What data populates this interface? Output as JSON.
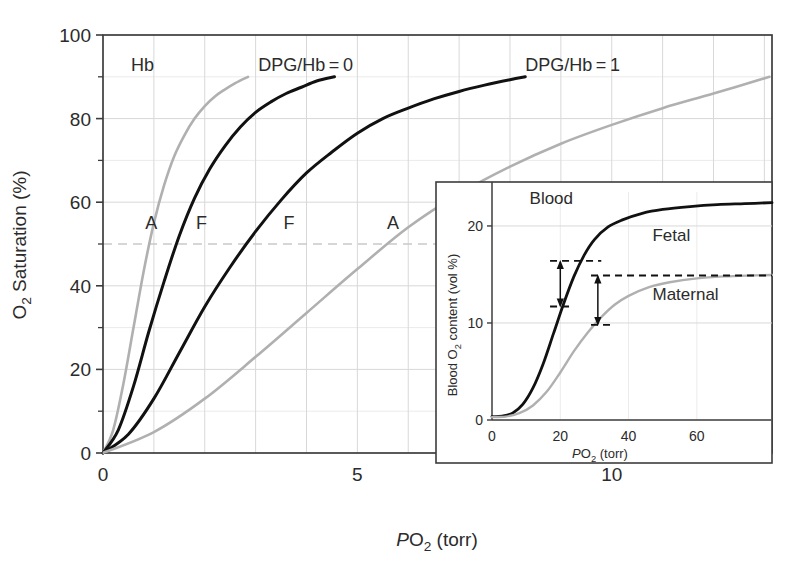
{
  "figure": {
    "background_color": "#ffffff",
    "frame_color": "#3c3c3c",
    "gridline_color_major": "#d8d8d8",
    "gridline_color_minor": "#ebebeb",
    "curve_color_dark": "#111111",
    "curve_color_light": "#b0b0b0",
    "dashed_marker_color": "#111111",
    "half_saturation_line_color": "#c9c9c9"
  },
  "chart_data": [
    {
      "id": "main",
      "type": "line",
      "title": "",
      "xlabel": "PO2 (torr)",
      "xlabel_parts": {
        "italic": "P",
        "normal": "O",
        "subscript": "2",
        "tail": " (torr)"
      },
      "ylabel": "O2 Saturation (%)",
      "ylabel_parts": {
        "normal": "O",
        "subscript": "2",
        "tail": " Saturation (%)"
      },
      "xlim": [
        0,
        13.15
      ],
      "ylim": [
        0,
        100
      ],
      "xticks": [
        0,
        5,
        10
      ],
      "xtick_labels": [
        "0",
        "5",
        "10"
      ],
      "yticks": [
        0,
        20,
        40,
        60,
        80,
        100
      ],
      "ytick_labels": [
        "0",
        "20",
        "40",
        "60",
        "80",
        "100"
      ],
      "y_major_gridlines": [
        20,
        40,
        60,
        80
      ],
      "y_minor_gridlines": [
        10,
        30,
        50,
        70,
        90
      ],
      "x_major_gridlines": [
        1,
        2,
        3,
        4,
        5,
        6,
        7,
        8,
        9,
        10,
        11,
        12,
        13
      ],
      "grid": true,
      "legend_position": "inline-annotations",
      "half_saturation_reference": 50,
      "annotations": [
        {
          "name": "hb-label",
          "text": "Hb",
          "x": 0.55,
          "y": 91.5
        },
        {
          "name": "dpg-hb-0-label",
          "text": "DPG/Hb = 0",
          "x": 3.05,
          "y": 91.5
        },
        {
          "name": "dpg-hb-1-label",
          "text": "DPG/Hb = 1",
          "x": 8.3,
          "y": 91.5
        },
        {
          "name": "curve-label-a-left",
          "text": "A",
          "x": 0.83,
          "y": 53.5
        },
        {
          "name": "curve-label-f-left",
          "text": "F",
          "x": 1.83,
          "y": 53.5
        },
        {
          "name": "curve-label-f-right",
          "text": "F",
          "x": 3.55,
          "y": 53.5
        },
        {
          "name": "curve-label-a-right",
          "text": "A",
          "x": 5.58,
          "y": 53.5
        }
      ],
      "series": [
        {
          "name": "Hb A, DPG/Hb = 0",
          "label": "A",
          "color": "#b0b0b0",
          "style": "solid",
          "p50": 1.06,
          "hill_n": 2.55,
          "ymax": 90,
          "x_end": 2.85,
          "points": [
            [
              0,
              0
            ],
            [
              0.2,
              5.5
            ],
            [
              0.4,
              16.5
            ],
            [
              0.6,
              30
            ],
            [
              0.8,
              43.5
            ],
            [
              1.0,
              55
            ],
            [
              1.2,
              64
            ],
            [
              1.4,
              71
            ],
            [
              1.6,
              76
            ],
            [
              1.8,
              80
            ],
            [
              2.0,
              83
            ],
            [
              2.2,
              85.3
            ],
            [
              2.4,
              87
            ],
            [
              2.6,
              88.5
            ],
            [
              2.85,
              90
            ]
          ]
        },
        {
          "name": "Hb F, DPG/Hb = 0",
          "label": "F",
          "color": "#111111",
          "style": "solid",
          "p50": 1.62,
          "hill_n": 2.55,
          "ymax": 90,
          "x_end": 4.55,
          "points": [
            [
              0,
              0
            ],
            [
              0.3,
              5.5
            ],
            [
              0.6,
              16
            ],
            [
              0.9,
              29
            ],
            [
              1.2,
              41
            ],
            [
              1.5,
              52
            ],
            [
              1.8,
              61
            ],
            [
              2.1,
              68
            ],
            [
              2.4,
              73.5
            ],
            [
              2.7,
              78
            ],
            [
              3.0,
              81.5
            ],
            [
              3.3,
              84
            ],
            [
              3.6,
              86
            ],
            [
              3.9,
              87.5
            ],
            [
              4.2,
              89
            ],
            [
              4.55,
              90
            ]
          ]
        },
        {
          "name": "Hb F, DPG/Hb = 1",
          "label": "F",
          "color": "#111111",
          "style": "solid",
          "p50": 3.05,
          "hill_n": 2.55,
          "ymax": 90,
          "x_end": 8.3,
          "points": [
            [
              0,
              0
            ],
            [
              0.5,
              4.5
            ],
            [
              1.0,
              13
            ],
            [
              1.5,
              24
            ],
            [
              2.0,
              35
            ],
            [
              2.5,
              44.5
            ],
            [
              3.0,
              53
            ],
            [
              3.5,
              60.5
            ],
            [
              4.0,
              67
            ],
            [
              4.5,
              72
            ],
            [
              5.0,
              76.5
            ],
            [
              5.5,
              80
            ],
            [
              6.0,
              82.5
            ],
            [
              6.5,
              84.7
            ],
            [
              7.0,
              86.5
            ],
            [
              7.5,
              88
            ],
            [
              8.0,
              89.3
            ],
            [
              8.3,
              90
            ]
          ]
        },
        {
          "name": "Hb A, DPG/Hb = 1",
          "label": "A",
          "color": "#b0b0b0",
          "style": "solid",
          "p50": 5.3,
          "hill_n": 2.55,
          "ymax": 90,
          "x_end": 13.1,
          "points": [
            [
              0,
              0
            ],
            [
              1.0,
              5
            ],
            [
              2.0,
              13
            ],
            [
              3.0,
              23
            ],
            [
              4.0,
              33.5
            ],
            [
              5.0,
              44
            ],
            [
              6.0,
              54
            ],
            [
              7.0,
              62
            ],
            [
              8.0,
              68.5
            ],
            [
              9.0,
              74
            ],
            [
              10.0,
              78.5
            ],
            [
              11.0,
              82.5
            ],
            [
              12.0,
              86
            ],
            [
              13.1,
              90
            ]
          ]
        }
      ]
    },
    {
      "id": "inset",
      "type": "line",
      "title": "Blood",
      "xlabel": "PO2 (torr)",
      "xlabel_parts": {
        "italic": "P",
        "normal": "O",
        "subscript": "2",
        "tail": " (torr)"
      },
      "ylabel": "Blood O2 content (vol %)",
      "ylabel_parts": {
        "prefix": "Blood O",
        "subscript": "2",
        "tail": " content (vol %)"
      },
      "xlim": [
        0,
        82
      ],
      "ylim": [
        0,
        23.5
      ],
      "xticks": [
        0,
        20,
        40,
        60
      ],
      "xtick_labels": [
        "0",
        "20",
        "40",
        "60"
      ],
      "yticks": [
        0,
        10,
        20
      ],
      "ytick_labels": [
        "0",
        "10",
        "20"
      ],
      "y_major_gridlines": [
        10,
        20
      ],
      "y_minor_gridlines": [],
      "x_major_gridlines": [
        20,
        40,
        60
      ],
      "grid": true,
      "legend_position": "inline-annotations",
      "annotations": [
        {
          "name": "blood-label",
          "text": "Blood",
          "x": 11,
          "y": 22.3
        },
        {
          "name": "fetal-label",
          "text": "Fetal",
          "x": 47,
          "y": 18.4
        },
        {
          "name": "maternal-label",
          "text": "Maternal",
          "x": 47,
          "y": 12.4
        }
      ],
      "arrows": [
        {
          "name": "fetal-delta-arrow",
          "x": 20,
          "y_low": 11.7,
          "y_high": 16.4,
          "dash_low_from": 17,
          "dash_low_to": 23.5,
          "dash_high_from": 17,
          "dash_high_to": 32
        },
        {
          "name": "maternal-delta-arrow",
          "x": 31,
          "y_low": 9.8,
          "y_high": 14.9,
          "dash_low_from": 29,
          "dash_low_to": 35.5,
          "dash_high_from": 29,
          "dash_high_to": 82
        }
      ],
      "series": [
        {
          "name": "Fetal",
          "label": "Fetal",
          "color": "#111111",
          "style": "solid",
          "points": [
            [
              0,
              0.35
            ],
            [
              3,
              0.4
            ],
            [
              6,
              0.7
            ],
            [
              9,
              1.6
            ],
            [
              12,
              3.3
            ],
            [
              15,
              5.8
            ],
            [
              18,
              8.9
            ],
            [
              21,
              12.0
            ],
            [
              24,
              14.8
            ],
            [
              27,
              17.0
            ],
            [
              30,
              18.6
            ],
            [
              34,
              19.9
            ],
            [
              38,
              20.6
            ],
            [
              44,
              21.3
            ],
            [
              50,
              21.7
            ],
            [
              58,
              22.0
            ],
            [
              66,
              22.2
            ],
            [
              74,
              22.3
            ],
            [
              82,
              22.4
            ]
          ]
        },
        {
          "name": "Maternal",
          "label": "Maternal",
          "color": "#b0b0b0",
          "style": "solid",
          "points": [
            [
              0,
              0.3
            ],
            [
              4,
              0.35
            ],
            [
              8,
              0.7
            ],
            [
              12,
              1.5
            ],
            [
              16,
              2.9
            ],
            [
              20,
              4.9
            ],
            [
              24,
              7.1
            ],
            [
              28,
              9.0
            ],
            [
              32,
              10.6
            ],
            [
              36,
              11.9
            ],
            [
              40,
              12.8
            ],
            [
              46,
              13.7
            ],
            [
              52,
              14.2
            ],
            [
              60,
              14.6
            ],
            [
              68,
              14.8
            ],
            [
              76,
              14.9
            ],
            [
              82,
              14.95
            ]
          ]
        }
      ]
    }
  ]
}
